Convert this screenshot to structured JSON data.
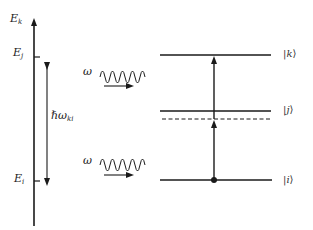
{
  "diagram": {
    "type": "energy-level diagram (two-photon absorption)",
    "energy_axis": {
      "top_label": {
        "base": "E",
        "sub": "k"
      },
      "ticks": [
        {
          "base": "E",
          "sub": "j"
        },
        {
          "base": "E",
          "sub": "i"
        }
      ]
    },
    "energy_gap_label": {
      "base": "ℏω",
      "sub": "ki"
    },
    "photons": [
      {
        "label": "ω"
      },
      {
        "label": "ω"
      }
    ],
    "levels": [
      {
        "name": "k",
        "ket_open": "|",
        "ket_state": "k",
        "ket_close": "⟩",
        "style": "solid"
      },
      {
        "name": "j",
        "ket_open": "|",
        "ket_state": "j",
        "ket_close": "⟩",
        "style": "solid"
      },
      {
        "name": "virtual",
        "style": "dashed"
      },
      {
        "name": "i",
        "ket_open": "|",
        "ket_state": "i",
        "ket_close": "⟩",
        "style": "solid"
      }
    ],
    "colors": {
      "ink": "#1a1a1a",
      "background": "#ffffff"
    }
  }
}
